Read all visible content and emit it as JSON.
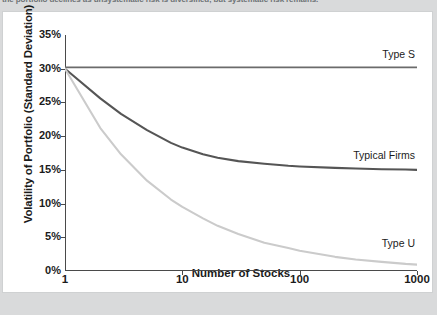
{
  "caption": {
    "text": "the portfolio declines as unsystematic risk is diversified, but systematic risk remains."
  },
  "figure": {
    "ylabel": "Volatility of Portfolio (Standard Deviation)",
    "xlabel": "Number of Stocks"
  },
  "chart_data": {
    "type": "line",
    "title": "",
    "xlabel": "Number of Stocks",
    "ylabel": "Volatility of Portfolio (Standard Deviation)",
    "xscale": "log",
    "xlim": [
      1,
      1000
    ],
    "ylim": [
      0,
      35
    ],
    "grid": false,
    "legend_position": "inline-right",
    "xticks": [
      1,
      10,
      100,
      1000
    ],
    "xtick_labels": [
      "1",
      "10",
      "100",
      "1000"
    ],
    "yticks": [
      0,
      5,
      10,
      15,
      20,
      25,
      30,
      35
    ],
    "ytick_labels": [
      "0%",
      "5%",
      "10%",
      "15%",
      "20%",
      "25%",
      "30%",
      "35%"
    ],
    "x": [
      1,
      2,
      3,
      5,
      8,
      10,
      15,
      20,
      30,
      50,
      80,
      100,
      200,
      300,
      500,
      800,
      1000
    ],
    "series": [
      {
        "name": "Type S",
        "color": "#6b6b6b",
        "width": 1.6,
        "label": "Type S",
        "label_x": 1000,
        "label_y": 32.0,
        "values": [
          30.2,
          30.2,
          30.2,
          30.2,
          30.2,
          30.2,
          30.2,
          30.2,
          30.2,
          30.2,
          30.2,
          30.2,
          30.2,
          30.2,
          30.2,
          30.2,
          30.2
        ]
      },
      {
        "name": "Typical Firms",
        "color": "#555555",
        "width": 2.1,
        "label": "Typical Firms",
        "label_x": 1000,
        "label_y": 17.0,
        "values": [
          30.0,
          25.6,
          23.3,
          20.9,
          19.0,
          18.3,
          17.3,
          16.8,
          16.3,
          15.9,
          15.6,
          15.5,
          15.3,
          15.2,
          15.1,
          15.05,
          15.0
        ]
      },
      {
        "name": "Type U",
        "color": "#cbcbcb",
        "width": 2.1,
        "label": "Type U",
        "label_x": 1000,
        "label_y": 4.0,
        "values": [
          30.0,
          21.2,
          17.3,
          13.4,
          10.6,
          9.5,
          7.8,
          6.7,
          5.5,
          4.2,
          3.4,
          3.0,
          2.1,
          1.7,
          1.35,
          1.05,
          0.95
        ]
      }
    ]
  }
}
